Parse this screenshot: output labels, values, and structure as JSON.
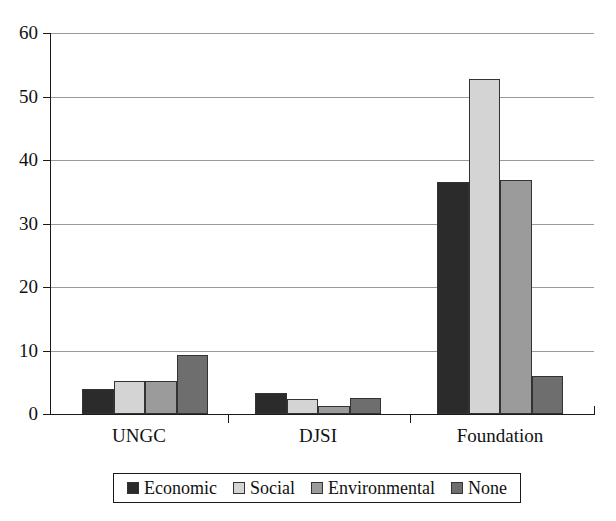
{
  "chart_data": {
    "type": "bar",
    "title": "",
    "subtitle": "",
    "xlabel": "",
    "ylabel": "",
    "categories": [
      "UNGC",
      "DJSI",
      "Foundation"
    ],
    "series": [
      {
        "name": "Economic",
        "color": "#2b2b2b",
        "values": [
          4.0,
          3.3,
          36.5
        ]
      },
      {
        "name": "Social",
        "color": "#d4d4d4",
        "values": [
          5.2,
          2.4,
          52.7
        ]
      },
      {
        "name": "Environmental",
        "color": "#9b9b9b",
        "values": [
          5.2,
          1.2,
          36.8
        ]
      },
      {
        "name": "None",
        "color": "#6e6e6e",
        "values": [
          9.3,
          2.6,
          6.0
        ]
      }
    ],
    "ylim": [
      0,
      60
    ],
    "yticks": [
      0,
      10,
      20,
      30,
      40,
      50,
      60
    ],
    "ytick_labels": [
      "0",
      "10",
      "20",
      "30",
      "40",
      "50",
      "60"
    ],
    "grid": true,
    "grid_axis": "y",
    "legend_position": "bottom",
    "legend_entries": [
      "Economic",
      "Social",
      "Environmental",
      "None"
    ]
  }
}
